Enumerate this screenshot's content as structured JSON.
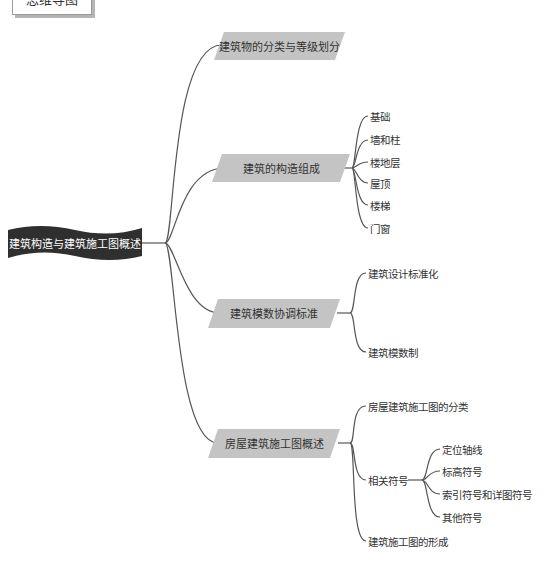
{
  "header": {
    "title": "思维导图"
  },
  "root": {
    "label": "建筑构造与建筑施工图概述"
  },
  "branches": [
    {
      "label": "建筑物的分类与等级划分",
      "children": []
    },
    {
      "label": "建筑的构造组成",
      "children": [
        "基础",
        "墙和柱",
        "楼地层",
        "屋顶",
        "楼梯",
        "门窗"
      ]
    },
    {
      "label": "建筑模数协调标准",
      "children": [
        "建筑设计标准化",
        "建筑模数制"
      ]
    },
    {
      "label": "房屋建筑施工图概述",
      "children": [
        "房屋建筑施工图的分类",
        "相关符号",
        "建筑施工图的形成"
      ],
      "sub": {
        "parent": "相关符号",
        "children": [
          "定位轴线",
          "标高符号",
          "索引符号和详图符号",
          "其他符号"
        ]
      }
    }
  ],
  "colors": {
    "root_bg": "#2f2f2f",
    "branch_bg": "#c4c4c4",
    "line": "#555555"
  }
}
